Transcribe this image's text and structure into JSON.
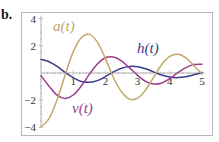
{
  "panel_label": "b.",
  "colors": {
    "a": "#c2a86a",
    "h": "#3c3a8a",
    "v": "#9a3d8a",
    "frame": "#b8b8b8",
    "axis": "#9a9a9a"
  },
  "chart_data": {
    "type": "line",
    "title": "",
    "xlabel": "",
    "ylabel": "",
    "xlim": [
      0,
      5
    ],
    "ylim": [
      -4,
      4
    ],
    "grid": false,
    "legend": "inline labels",
    "x_ticks": [
      1,
      2,
      3,
      4,
      5
    ],
    "y_ticks": [
      4,
      2,
      -2,
      -4
    ],
    "x_tick_labels": [
      "1",
      "2",
      "3",
      "4",
      "5"
    ],
    "y_tick_labels": [
      "4",
      "2",
      "−2",
      "−4"
    ],
    "series": [
      {
        "name": "a(t)",
        "label": "a(t)",
        "color": "#c2a86a",
        "x": [
          0,
          0.25,
          0.5,
          0.75,
          1,
          1.25,
          1.5,
          1.75,
          2,
          2.25,
          2.5,
          2.75,
          3,
          3.25,
          3.5,
          3.75,
          4,
          4.25,
          4.5,
          4.75,
          5
        ],
        "values": [
          -3.96,
          -3.35,
          -1.97,
          -0.15,
          1.55,
          2.59,
          2.84,
          2.27,
          1.06,
          -0.33,
          -1.38,
          -1.92,
          -1.85,
          -1.24,
          -0.31,
          0.62,
          1.22,
          1.38,
          1.11,
          0.54,
          -0.07
        ]
      },
      {
        "name": "h(t)",
        "label": "h(t)",
        "color": "#3c3a8a",
        "x": [
          0,
          0.25,
          0.5,
          0.75,
          1,
          1.25,
          1.5,
          1.75,
          2,
          2.25,
          2.5,
          2.75,
          3,
          3.25,
          3.5,
          3.75,
          4,
          4.25,
          4.5,
          4.75,
          5
        ],
        "values": [
          1.0,
          0.83,
          0.49,
          0.04,
          -0.34,
          -0.62,
          -0.68,
          -0.56,
          -0.26,
          0.08,
          0.35,
          0.48,
          0.46,
          0.31,
          0.08,
          -0.15,
          -0.3,
          -0.34,
          -0.28,
          -0.13,
          0.02
        ]
      },
      {
        "name": "v(t)",
        "label": "v(t)",
        "color": "#9a3d8a",
        "x": [
          0,
          0.25,
          0.5,
          0.75,
          1,
          1.25,
          1.5,
          1.75,
          2,
          2.25,
          2.5,
          2.75,
          3,
          3.25,
          3.5,
          3.75,
          4,
          4.25,
          4.5,
          4.75,
          5
        ],
        "values": [
          -0.2,
          -0.97,
          -1.63,
          -1.87,
          -1.62,
          -0.96,
          -0.1,
          0.66,
          1.12,
          1.18,
          0.89,
          0.38,
          -0.17,
          -0.61,
          -0.81,
          -0.73,
          -0.42,
          0.03,
          0.4,
          0.62,
          0.65
        ]
      }
    ]
  },
  "labels": {
    "a": "a(t)",
    "h": "h(t)",
    "v": "v(t)"
  }
}
